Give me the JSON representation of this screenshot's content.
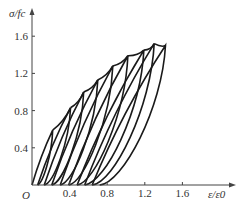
{
  "chart_data": {
    "type": "line",
    "title": "",
    "xlabel": "ε/ε0",
    "ylabel": "σ/fc",
    "origin_label": "O",
    "xlim": [
      0,
      1.8
    ],
    "ylim": [
      0,
      1.75
    ],
    "x_ticks": [
      0.4,
      0.8,
      1.2,
      1.6
    ],
    "x_tick_labels": [
      "0.4",
      "0.8",
      "1.2",
      "1.6"
    ],
    "y_ticks": [
      0.4,
      0.8,
      1.2,
      1.6
    ],
    "y_tick_labels": [
      "0.4",
      "0.8",
      "1.2",
      "1.6"
    ],
    "grid": false,
    "legend": null,
    "loops": [
      {
        "peak": [
          0.22,
          0.59
        ],
        "residual_strain": 0.0
      },
      {
        "peak": [
          0.41,
          0.83
        ],
        "residual_strain": 0.06
      },
      {
        "peak": [
          0.55,
          1.0
        ],
        "residual_strain": 0.13
      },
      {
        "peak": [
          0.7,
          1.13
        ],
        "residual_strain": 0.21
      },
      {
        "peak": [
          0.86,
          1.28
        ],
        "residual_strain": 0.3
      },
      {
        "peak": [
          1.02,
          1.39
        ],
        "residual_strain": 0.39
      },
      {
        "peak": [
          1.19,
          1.45
        ],
        "residual_strain": 0.48
      },
      {
        "peak": [
          1.3,
          1.52
        ],
        "residual_strain": 0.56
      },
      {
        "peak": [
          1.42,
          1.5
        ],
        "residual_strain": 0.64
      }
    ],
    "color": "#1a1a1a"
  }
}
